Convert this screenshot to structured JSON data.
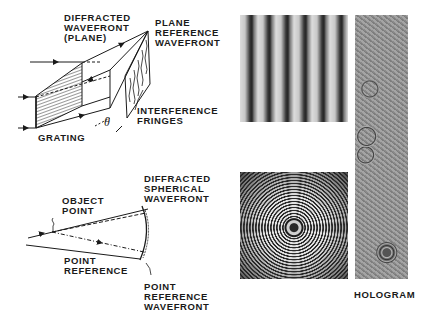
{
  "top_diagram": {
    "labels": {
      "diffracted_wavefront": "DIFFRACTED\nWAVEFRONT\n(PLANE)",
      "plane_reference_wavefront": "PLANE\nREFERENCE\nWAVEFRONT",
      "interference_fringes": "INTERFERENCE\nFRINGES",
      "grating": "GRATING",
      "theta": "θ"
    }
  },
  "bottom_diagram": {
    "labels": {
      "object_point": "OBJECT\nPOINT",
      "diffracted_spherical_wavefront": "DIFFRACTED\nSPHERICAL\nWAVEFRONT",
      "point_reference": "POINT\nREFERENCE",
      "point_reference_wavefront": "POINT\nREFERENCE\nWAVEFRONT"
    }
  },
  "photos": {
    "fringes": "interference-fringes-photo",
    "zone_plate": "zone-plate-photo",
    "hologram": "hologram-photo",
    "hologram_caption": "HOLOGRAM"
  }
}
